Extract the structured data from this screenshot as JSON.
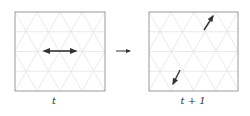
{
  "diagram": {
    "panels": [
      {
        "id": "left",
        "label": "t",
        "box": {
          "x": 15,
          "y": 12,
          "w": 90,
          "h": 79
        },
        "arrows": [
          {
            "type": "double",
            "x1": 42,
            "y1": 51,
            "x2": 78,
            "y2": 51
          }
        ]
      },
      {
        "id": "right",
        "label": "t + 1",
        "box": {
          "x": 149,
          "y": 12,
          "w": 89,
          "h": 79
        },
        "arrows": [
          {
            "type": "single",
            "x1": 204,
            "y1": 30,
            "x2": 214,
            "y2": 15
          },
          {
            "type": "single",
            "x1": 180,
            "y1": 70,
            "x2": 172,
            "y2": 85
          }
        ]
      }
    ],
    "transition_arrow": {
      "x1": 116,
      "y1": 51,
      "x2": 132,
      "y2": 51
    },
    "colors": {
      "box_border": "#9a9a9a",
      "grid": "#e4e4e4",
      "arrow": "#333333",
      "text": "#333333"
    }
  }
}
